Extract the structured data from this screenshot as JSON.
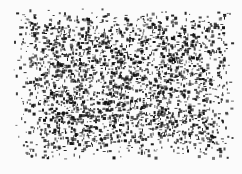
{
  "image": {
    "description": "Dense black speckle / noise texture on white background, no legible text",
    "width": 242,
    "height": 174,
    "background_color": "#fbfbfb",
    "ink_color": "#111111",
    "texture_region": {
      "x": 12,
      "y": 8,
      "width": 222,
      "height": 152
    },
    "speckle": {
      "seed": 7,
      "count": 2600,
      "min_size": 1,
      "max_size": 3,
      "edge_falloff": 0.35
    }
  }
}
